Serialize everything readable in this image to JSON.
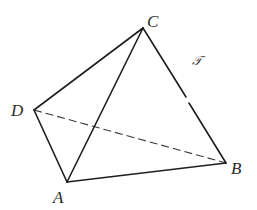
{
  "diagram": {
    "stroke_color": "#1e1e1e",
    "background": "#ffffff",
    "vertices": {
      "A": {
        "label": "A",
        "x": 67,
        "y": 182
      },
      "B": {
        "label": "B",
        "x": 226,
        "y": 163
      },
      "C": {
        "label": "C",
        "x": 143,
        "y": 28
      },
      "D": {
        "label": "D",
        "x": 34,
        "y": 110
      }
    },
    "edges": [
      {
        "from": "D",
        "to": "C",
        "style": "solid"
      },
      {
        "from": "C",
        "to": "A",
        "style": "solid"
      },
      {
        "from": "C",
        "to": "B",
        "style": "solid",
        "note": "small gap near midpoint"
      },
      {
        "from": "D",
        "to": "A",
        "style": "solid"
      },
      {
        "from": "A",
        "to": "B",
        "style": "solid"
      },
      {
        "from": "D",
        "to": "B",
        "style": "dashed",
        "note": "hidden edge"
      }
    ],
    "surface_label": "𝒯",
    "labels": {
      "A": "A",
      "B": "B",
      "C": "C",
      "D": "D"
    }
  }
}
